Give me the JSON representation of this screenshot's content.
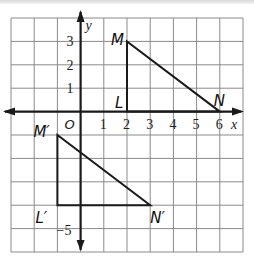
{
  "diagram": {
    "type": "coordinate-plane-translation",
    "grid": {
      "xmin": -3,
      "xmax": 7,
      "ymin": -6,
      "ymax": 4,
      "color": "#8a8a8a"
    },
    "axes": {
      "x_label": "x",
      "y_label": "y",
      "origin_label": "O",
      "x_ticks": [
        "1",
        "2",
        "3",
        "4",
        "5",
        "6"
      ],
      "y_ticks": [
        "3",
        "2",
        "1"
      ],
      "y_tick_bottom": "−5"
    },
    "triangles": [
      {
        "name": "original",
        "vertices": [
          {
            "label": "M",
            "x": 2,
            "y": 3
          },
          {
            "label": "L",
            "x": 2,
            "y": 0
          },
          {
            "label": "N",
            "x": 6,
            "y": 0
          }
        ]
      },
      {
        "name": "image",
        "vertices": [
          {
            "label": "M′",
            "x": -1,
            "y": -1
          },
          {
            "label": "L′",
            "x": -1,
            "y": -4
          },
          {
            "label": "N′",
            "x": 3,
            "y": -4
          }
        ]
      }
    ],
    "line_color": "#1a1a1a"
  }
}
